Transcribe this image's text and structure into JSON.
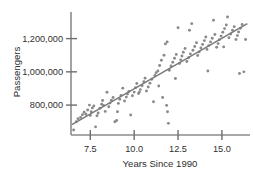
{
  "chart_data": {
    "type": "scatter",
    "title": "",
    "xlabel": "Years Since 1990",
    "ylabel": "Passengers",
    "xlim": [
      6.4,
      16.6
    ],
    "ylim": [
      620000,
      1360000
    ],
    "grid": false,
    "legend": null,
    "xticks": [
      7.5,
      10.0,
      12.5,
      15.0
    ],
    "xticklabels": [
      "7.5",
      "10.0",
      "12.5",
      "15.0"
    ],
    "yticks": [
      800000,
      1000000,
      1200000
    ],
    "yticklabels": [
      "800,000",
      "1,000,000",
      "1,200,000"
    ],
    "marker_color": "#8a8a8a",
    "line_color": "#7a7a7a",
    "trendline": {
      "type": "linear",
      "x_start": 6.45,
      "y_start": 683000,
      "x_end": 16.45,
      "y_end": 1290000
    },
    "x": [
      6.55,
      6.7,
      6.8,
      6.95,
      7.05,
      7.15,
      7.25,
      7.35,
      7.45,
      7.5,
      7.55,
      7.62,
      7.7,
      7.8,
      7.88,
      7.95,
      8.05,
      8.15,
      8.25,
      8.35,
      8.45,
      8.55,
      8.62,
      8.7,
      8.8,
      8.9,
      9.0,
      9.1,
      9.18,
      9.25,
      9.35,
      9.45,
      9.55,
      9.62,
      9.7,
      9.8,
      9.9,
      10.0,
      10.08,
      10.15,
      10.25,
      10.35,
      10.45,
      10.55,
      10.62,
      10.7,
      10.8,
      10.9,
      11.0,
      11.1,
      11.18,
      11.25,
      11.35,
      11.45,
      11.55,
      11.62,
      11.7,
      11.78,
      11.85,
      11.9,
      11.95,
      12.0,
      12.1,
      12.2,
      12.3,
      12.4,
      12.5,
      12.58,
      12.65,
      12.72,
      12.8,
      12.9,
      13.0,
      13.1,
      13.2,
      13.28,
      13.35,
      13.45,
      13.55,
      13.62,
      13.7,
      13.8,
      13.9,
      14.0,
      14.08,
      14.15,
      14.25,
      14.35,
      14.45,
      14.52,
      14.6,
      14.7,
      14.78,
      14.85,
      14.95,
      15.05,
      15.15,
      15.25,
      15.32,
      15.4,
      15.5,
      15.6,
      15.7,
      15.8,
      15.88,
      15.95,
      16.05,
      16.15,
      16.25,
      16.35,
      8.2,
      9.05,
      10.3,
      11.4,
      11.88,
      12.35,
      13.15,
      14.2,
      15.1,
      16.0
    ],
    "y": [
      650000,
      700000,
      718000,
      726000,
      742000,
      757000,
      745000,
      770000,
      800000,
      738000,
      760000,
      783000,
      795000,
      669000,
      736000,
      752000,
      781000,
      805000,
      798000,
      762000,
      877000,
      790000,
      812000,
      829000,
      846000,
      700000,
      707000,
      810000,
      835000,
      858000,
      902000,
      825000,
      848000,
      866000,
      882000,
      740000,
      856000,
      878000,
      905000,
      930000,
      870000,
      893000,
      916000,
      940000,
      962000,
      885000,
      909000,
      932000,
      955000,
      820000,
      978000,
      995000,
      1005000,
      1038000,
      1070000,
      846000,
      1100000,
      1168000,
      798000,
      760000,
      690000,
      1010000,
      1035000,
      1058000,
      1082000,
      1105000,
      1265000,
      1050000,
      1072000,
      1095000,
      1118000,
      1140000,
      1062000,
      1085000,
      1108000,
      1290000,
      1130000,
      1152000,
      1175000,
      1098000,
      1120000,
      1143000,
      1165000,
      1188000,
      1210000,
      1135000,
      1158000,
      1180000,
      1202000,
      1310000,
      1225000,
      1148000,
      1170000,
      1193000,
      1215000,
      1238000,
      1260000,
      1282000,
      1330000,
      1205000,
      1228000,
      1250000,
      1272000,
      1195000,
      1218000,
      1240000,
      1262000,
      1285000,
      1000000,
      1195000,
      828000,
      760000,
      878000,
      915000,
      1180000,
      960000,
      1250000,
      1005000,
      1150000,
      990000
    ]
  },
  "axes": {
    "x_tick_label_0": "7.5",
    "x_tick_label_1": "10.0",
    "x_tick_label_2": "12.5",
    "x_tick_label_3": "15.0",
    "y_tick_label_0": "800,000",
    "y_tick_label_1": "1,000,000",
    "y_tick_label_2": "1,200,000",
    "x_axis_title": "Years Since 1990",
    "y_axis_title": "Passengers"
  }
}
